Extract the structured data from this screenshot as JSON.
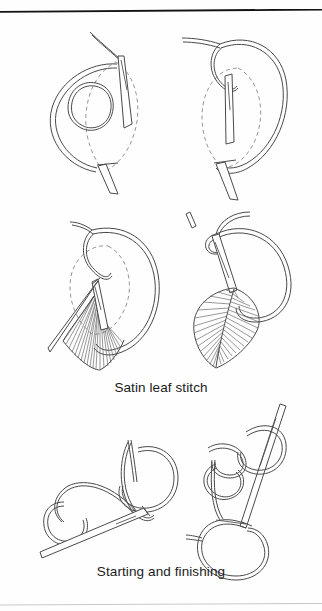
{
  "page": {
    "background_color": "#fefefe",
    "ink_color": "#4a4a4a",
    "dash_color": "#8a8a8a",
    "rule_top_color": "#121212",
    "rule_bottom_color": "#c9c9c9"
  },
  "captions": [
    {
      "id": "satin-leaf-stitch",
      "text": "Satin leaf stitch"
    },
    {
      "id": "starting-and-finishing",
      "text": "Starting and finishing"
    }
  ],
  "diagram_data": {
    "type": "instructional-line-art",
    "subject": "Hand embroidery stitch technique",
    "panel_count": 6,
    "rows": [
      {
        "row": 1,
        "caption_id": "satin-leaf-stitch",
        "panels": [
          {
            "index": 1,
            "name": "satin-leaf-step-1",
            "description": "Needle entering fabric at the leaf tip with a large thread loop held to the left and the dashed leaf outline behind",
            "elements": [
              "needle",
              "thread-loop",
              "small-thread-loop",
              "dashed-leaf-outline",
              "thread-tail"
            ]
          },
          {
            "index": 2,
            "name": "satin-leaf-step-2",
            "description": "Needle drawn down through the centre of the dashed leaf outline, thread loop pulled to the right forming the centre vein",
            "elements": [
              "needle",
              "thread-loop",
              "dashed-leaf-outline",
              "centre-vein",
              "thread-tail"
            ]
          }
        ]
      },
      {
        "row": 2,
        "caption_id": "satin-leaf-stitch",
        "panels": [
          {
            "index": 3,
            "name": "satin-leaf-step-3",
            "description": "Partially worked leaf: fan of satin stitches filling the lower half while the dashed outline shows the unworked area",
            "elements": [
              "needle",
              "thread-loop",
              "dashed-leaf-outline",
              "satin-stitch-fan",
              "centre-vein"
            ]
          },
          {
            "index": 4,
            "name": "satin-leaf-step-4",
            "description": "Completed satin leaf with dense diagonal stitches worked on both sides of the centre vein and the working thread looped above",
            "elements": [
              "finished-leaf",
              "satin-stitch-fill",
              "centre-vein",
              "thread-loop",
              "needle"
            ]
          }
        ]
      },
      {
        "row": 3,
        "caption_id": "starting-and-finishing",
        "panels": [
          {
            "index": 5,
            "name": "starting-and-finishing-step-1",
            "description": "Needle lying diagonally with the working thread crossed into two open loops forming the start knot",
            "elements": [
              "needle",
              "thread-loop-upper",
              "thread-loop-lower",
              "crossing-point",
              "thread-tail"
            ]
          },
          {
            "index": 6,
            "name": "starting-and-finishing-step-2",
            "description": "Needle held upright passing through stacked thread loops as the finishing knot is tightened",
            "elements": [
              "needle",
              "thread-loop-upper",
              "thread-loop-middle",
              "thread-loop-lower",
              "thread-tail"
            ]
          }
        ]
      }
    ]
  }
}
